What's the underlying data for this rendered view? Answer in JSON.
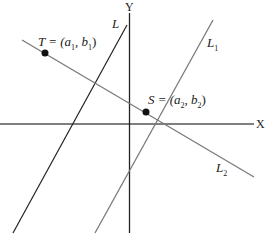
{
  "diagram": {
    "axes": {
      "x_label": "X",
      "y_label": "Y"
    },
    "lines": [
      {
        "name": "L",
        "label": "L",
        "color": "#222222"
      },
      {
        "name": "L1",
        "label": "L",
        "sub": "1",
        "color": "#7a7a7a"
      },
      {
        "name": "L2",
        "label": "L",
        "sub": "2",
        "color": "#7a7a7a"
      }
    ],
    "points": [
      {
        "name": "T",
        "label": "T = (a",
        "sub1": "1",
        "mid": ", b",
        "sub2": "1",
        "end": ")"
      },
      {
        "name": "S",
        "label": "S = (a",
        "sub1": "2",
        "mid": ", b",
        "sub2": "2",
        "end": ")"
      }
    ]
  }
}
